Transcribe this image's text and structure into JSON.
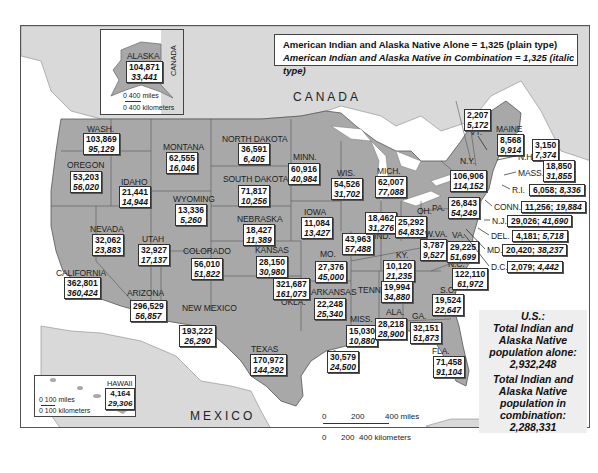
{
  "legend": {
    "alone": "American Indian and Alaska Native Alone = 1,325 (plain type)",
    "combination": "American Indian and Alaska Native in Combination = 1,325 (italic type)"
  },
  "countries": {
    "canada": "CANADA",
    "mexico": "MEXICO",
    "canada_inset": "CANADA"
  },
  "totals": {
    "heading": "U.S.:",
    "alone_label": "Total Indian and Alaska Native population alone:",
    "alone_value": "2,932,248",
    "combination_label": "Total Indian and Alaska Native population in combination:",
    "combination_value": "2,288,331"
  },
  "scales": {
    "alaska": {
      "miles": "0      400 miles",
      "km": "0   400 kilometers"
    },
    "hawaii": {
      "miles": "0      100 miles",
      "km": "0  100 kilometers"
    },
    "main": {
      "miles_ticks": [
        "0",
        "200",
        "400 miles"
      ],
      "km_ticks": [
        "0",
        "200",
        "400 kilometers"
      ]
    }
  },
  "states": [
    {
      "name": "ALASKA",
      "alone": "104,871",
      "combination": "33,441"
    },
    {
      "name": "HAWAII",
      "alone": "4,164",
      "combination": "29,306"
    },
    {
      "name": "WASH.",
      "alone": "103,869",
      "combination": "95,129"
    },
    {
      "name": "OREGON",
      "alone": "53,203",
      "combination": "56,020"
    },
    {
      "name": "CALIFORNIA",
      "alone": "362,801",
      "combination": "360,424"
    },
    {
      "name": "NEVADA",
      "alone": "32,062",
      "combination": "23,883"
    },
    {
      "name": "IDAHO",
      "alone": "21,441",
      "combination": "14,944"
    },
    {
      "name": "MONTANA",
      "alone": "62,555",
      "combination": "16,046"
    },
    {
      "name": "WYOMING",
      "alone": "13,336",
      "combination": "5,260"
    },
    {
      "name": "UTAH",
      "alone": "32,927",
      "combination": "17,137"
    },
    {
      "name": "COLORADO",
      "alone": "56,010",
      "combination": "51,822"
    },
    {
      "name": "ARIZONA",
      "alone": "296,529",
      "combination": "56,857"
    },
    {
      "name": "NEW MEXICO",
      "alone": "193,222",
      "combination": "26,290"
    },
    {
      "name": "NORTH DAKOTA",
      "alone": "36,591",
      "combination": "6,405"
    },
    {
      "name": "SOUTH DAKOTA",
      "alone": "71,817",
      "combination": "10,256"
    },
    {
      "name": "NEBRASKA",
      "alone": "18,427",
      "combination": "11,389"
    },
    {
      "name": "KANSAS",
      "alone": "28,150",
      "combination": "30,980"
    },
    {
      "name": "OKLA.",
      "alone": "321,687",
      "combination": "161,073"
    },
    {
      "name": "TEXAS",
      "alone": "170,972",
      "combination": "144,292"
    },
    {
      "name": "MINN.",
      "alone": "60,916",
      "combination": "40,984"
    },
    {
      "name": "IOWA",
      "alone": "11,084",
      "combination": "13,427"
    },
    {
      "name": "MO.",
      "alone": "27,376",
      "combination": "45,000"
    },
    {
      "name": "ARKANSAS",
      "alone": "22,248",
      "combination": "25,340"
    },
    {
      "name": "LA.",
      "alone": "30,579",
      "combination": "24,500"
    },
    {
      "name": "WIS.",
      "alone": "54,526",
      "combination": "31,702"
    },
    {
      "name": "ILL.",
      "alone": "43,963",
      "combination": "57,488"
    },
    {
      "name": "MICH.",
      "alone": "62,007",
      "combination": "77,088"
    },
    {
      "name": "IND.",
      "alone": "18,462",
      "combination": "31,276"
    },
    {
      "name": "OH.",
      "alone": "25,292",
      "combination": "64,832"
    },
    {
      "name": "KY.",
      "alone": "10,120",
      "combination": "21,235"
    },
    {
      "name": "TENN.",
      "alone": "19,994",
      "combination": "34,880"
    },
    {
      "name": "MISS.",
      "alone": "15,030",
      "combination": "10,880"
    },
    {
      "name": "ALA.",
      "alone": "28,218",
      "combination": "28,900"
    },
    {
      "name": "GA.",
      "alone": "32,151",
      "combination": "51,873"
    },
    {
      "name": "FLA.",
      "alone": "71,458",
      "combination": "91,104"
    },
    {
      "name": "S.C.",
      "alone": "19,524",
      "combination": "22,647"
    },
    {
      "name": "N.C.",
      "alone": "122,110",
      "combination": "61,972"
    },
    {
      "name": "VA.",
      "alone": "29,225",
      "combination": "51,699"
    },
    {
      "name": "W.VA.",
      "alone": "3,787",
      "combination": "9,527"
    },
    {
      "name": "PA.",
      "alone": "26,843",
      "combination": "54,249"
    },
    {
      "name": "N.Y.",
      "alone": "106,906",
      "combination": "114,152"
    },
    {
      "name": "VT.",
      "alone": "2,207",
      "combination": "5,172"
    },
    {
      "name": "N.H.",
      "alone": "3,150",
      "combination": "7,374"
    },
    {
      "name": "MAINE",
      "alone": "8,568",
      "combination": "9,914"
    },
    {
      "name": "MASS.",
      "alone": "18,850",
      "combination": "31,855"
    },
    {
      "name": "R.I.",
      "alone": "6,058",
      "combination": "8,336"
    },
    {
      "name": "CONN.",
      "alone": "11,256",
      "combination": "19,884"
    },
    {
      "name": "N.J.",
      "alone": "29,026",
      "combination": "41,690"
    },
    {
      "name": "DEL.",
      "alone": "4,181",
      "combination": "5,718"
    },
    {
      "name": "MD.",
      "alone": "20,420",
      "combination": "38,237"
    },
    {
      "name": "D.C.",
      "alone": "2,079",
      "combination": "4,442"
    }
  ],
  "colors": {
    "state_fill": "#a8a8a8",
    "foreign_land": "#d9d9d9",
    "water": "#ffffff",
    "label_box": "#ffffff"
  }
}
